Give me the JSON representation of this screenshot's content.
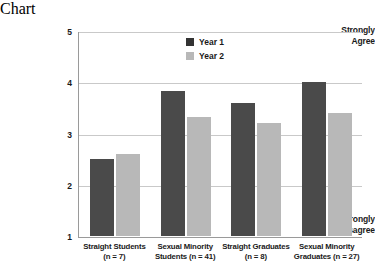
{
  "chart_data": {
    "type": "bar",
    "title": "",
    "xlabel": "",
    "ylabel": "",
    "ylim": [
      1,
      5
    ],
    "yticks": [
      1,
      2,
      3,
      4,
      5
    ],
    "grid": true,
    "legend_position": "top-center",
    "axis_annotations": {
      "top": "Strongly Agree",
      "top_line1": "Strongly",
      "top_line2": "Agree",
      "bottom": "Strongly Disagree",
      "bottom_line1": "Strongly",
      "bottom_line2": "Disagree"
    },
    "categories": [
      "Straight Students (n = 7)",
      "Sexual Minority Students (n = 41)",
      "Straight Graduates (n = 8)",
      "Sexual Minority Graduates (n = 27)"
    ],
    "category_lines": [
      {
        "line1": "Straight Students",
        "line2": "(n = 7)"
      },
      {
        "line1": "Sexual Minority",
        "line2": "Students (n = 41)"
      },
      {
        "line1": "Straight Graduates",
        "line2": "(n = 8)"
      },
      {
        "line1": "Sexual Minority",
        "line2": "Graduates (n = 27)"
      }
    ],
    "series": [
      {
        "name": "Year 1",
        "color": "#4a4a4a",
        "values": [
          2.5,
          3.82,
          3.6,
          4.0
        ]
      },
      {
        "name": "Year 2",
        "color": "#b8b8b8",
        "values": [
          2.6,
          3.33,
          3.2,
          3.4
        ]
      }
    ]
  },
  "legend": {
    "items": [
      {
        "label": "Year 1",
        "color": "#333333"
      },
      {
        "label": "Year 2",
        "color": "#b8b8b8"
      }
    ]
  },
  "colors": {
    "year1": "#4a4a4a",
    "year2": "#b8b8b8",
    "gridline": "#c9c9c9",
    "axis": "#9a9a9a",
    "text": "#1a1a1a",
    "background": "#ffffff"
  }
}
